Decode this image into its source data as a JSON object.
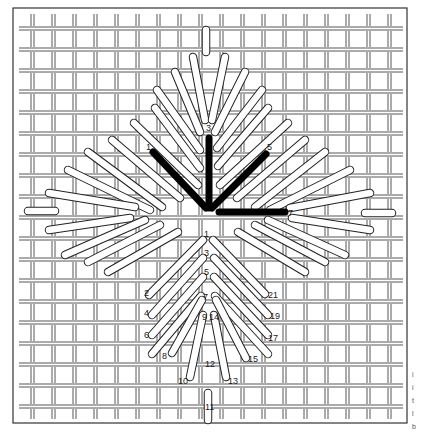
{
  "diagram": {
    "colors": {
      "background": "#ffffff",
      "frame": "#333333",
      "canvas_thread": "#444444",
      "stitch_fill": "#ffffff",
      "stitch_outline": "#222222",
      "highlight_stitch": "#000000",
      "label": "#1a1a1a"
    },
    "frame": {
      "x": 13,
      "y": 8,
      "w": 394,
      "h": 415
    },
    "grid": {
      "x_start": 31,
      "y_start": 27,
      "spacing": 21,
      "count_x": 18,
      "count_y": 19,
      "thread_gap": 3,
      "extent_x": [
        19,
        403
      ],
      "extent_y": [
        14,
        419
      ]
    },
    "top_leaf": {
      "description": "Upper leaf with highlighted first stitches",
      "highlight_stitches": [
        {
          "from": [
            153,
            152
          ],
          "to": [
            206,
            208
          ],
          "label": "1"
        },
        {
          "from": [
            209,
            138
          ],
          "to": [
            209,
            208
          ],
          "label": "3"
        },
        {
          "from": [
            266,
            154
          ],
          "to": [
            212,
            208
          ],
          "label": "5"
        },
        {
          "from": [
            219,
            212
          ],
          "to": [
            285,
            212
          ],
          "label": "7"
        }
      ],
      "white_stitches": [
        [
          [
            206,
            30
          ],
          [
            206,
            52
          ]
        ],
        [
          [
            193,
            57
          ],
          [
            205,
            120
          ]
        ],
        [
          [
            225,
            57
          ],
          [
            212,
            120
          ]
        ],
        [
          [
            175,
            72
          ],
          [
            200,
            132
          ]
        ],
        [
          [
            245,
            72
          ],
          [
            215,
            132
          ]
        ],
        [
          [
            157,
            90
          ],
          [
            200,
            150
          ]
        ],
        [
          [
            262,
            90
          ],
          [
            217,
            148
          ]
        ],
        [
          [
            155,
            108
          ],
          [
            200,
            168
          ]
        ],
        [
          [
            268,
            108
          ],
          [
            218,
            166
          ]
        ],
        [
          [
            134,
            123
          ],
          [
            198,
            185
          ]
        ],
        [
          [
            288,
            123
          ],
          [
            220,
            185
          ]
        ],
        [
          [
            112,
            140
          ],
          [
            180,
            198
          ]
        ],
        [
          [
            305,
            140
          ],
          [
            237,
            198
          ]
        ],
        [
          [
            88,
            152
          ],
          [
            162,
            207
          ]
        ],
        [
          [
            325,
            152
          ],
          [
            255,
            207
          ]
        ],
        [
          [
            68,
            170
          ],
          [
            150,
            210
          ]
        ],
        [
          [
            350,
            170
          ],
          [
            270,
            210
          ]
        ],
        [
          [
            49,
            193
          ],
          [
            135,
            207
          ]
        ],
        [
          [
            370,
            193
          ],
          [
            290,
            208
          ]
        ],
        [
          [
            28,
            211
          ],
          [
            55,
            211
          ]
        ],
        [
          [
            365,
            213
          ],
          [
            392,
            213
          ]
        ],
        [
          [
            49,
            230
          ],
          [
            130,
            218
          ]
        ],
        [
          [
            370,
            230
          ],
          [
            292,
            218
          ]
        ],
        [
          [
            65,
            255
          ],
          [
            145,
            220
          ]
        ],
        [
          [
            345,
            255
          ],
          [
            268,
            220
          ]
        ],
        [
          [
            88,
            262
          ],
          [
            160,
            225
          ]
        ],
        [
          [
            325,
            262
          ],
          [
            255,
            225
          ]
        ],
        [
          [
            108,
            272
          ],
          [
            178,
            232
          ]
        ],
        [
          [
            305,
            272
          ],
          [
            238,
            232
          ]
        ]
      ],
      "labels": [
        {
          "text": "1",
          "x": 146,
          "y": 150
        },
        {
          "text": "3",
          "x": 206,
          "y": 131
        },
        {
          "text": "5",
          "x": 267,
          "y": 150
        },
        {
          "text": "7",
          "x": 288,
          "y": 216
        }
      ]
    },
    "bottom_leaf": {
      "description": "Lower leaf with numbered stitch sequence",
      "white_stitches": [
        [
          [
            149,
            295
          ],
          [
            203,
            240
          ]
        ],
        [
          [
            265,
            294
          ],
          [
            213,
            240
          ]
        ],
        [
          [
            152,
            315
          ],
          [
            203,
            258
          ]
        ],
        [
          [
            268,
            315
          ],
          [
            214,
            258
          ]
        ],
        [
          [
            152,
            335
          ],
          [
            203,
            277
          ]
        ],
        [
          [
            268,
            335
          ],
          [
            214,
            277
          ]
        ],
        [
          [
            152,
            354
          ],
          [
            201,
            296
          ]
        ],
        [
          [
            268,
            354
          ],
          [
            215,
            296
          ]
        ],
        [
          [
            172,
            353
          ],
          [
            202,
            300
          ]
        ],
        [
          [
            246,
            358
          ],
          [
            216,
            300
          ]
        ],
        [
          [
            190,
            377
          ],
          [
            203,
            315
          ]
        ],
        [
          [
            226,
            377
          ],
          [
            214,
            315
          ]
        ],
        [
          [
            208,
            393
          ],
          [
            208,
            420
          ]
        ]
      ],
      "labels": [
        {
          "text": "1",
          "x": 204,
          "y": 237
        },
        {
          "text": "3",
          "x": 204,
          "y": 256
        },
        {
          "text": "5",
          "x": 204,
          "y": 275
        },
        {
          "text": "7",
          "x": 203,
          "y": 300
        },
        {
          "text": "2",
          "x": 144,
          "y": 296
        },
        {
          "text": "4",
          "x": 144,
          "y": 316
        },
        {
          "text": "6",
          "x": 144,
          "y": 338
        },
        {
          "text": "8",
          "x": 162,
          "y": 359
        },
        {
          "text": "9",
          "x": 202,
          "y": 320
        },
        {
          "text": "14",
          "x": 209,
          "y": 320
        },
        {
          "text": "10",
          "x": 178,
          "y": 384
        },
        {
          "text": "12",
          "x": 205,
          "y": 367
        },
        {
          "text": "11",
          "x": 205,
          "y": 410
        },
        {
          "text": "13",
          "x": 228,
          "y": 384
        },
        {
          "text": "15",
          "x": 248,
          "y": 362
        },
        {
          "text": "17",
          "x": 268,
          "y": 341
        },
        {
          "text": "19",
          "x": 270,
          "y": 319
        },
        {
          "text": "21",
          "x": 268,
          "y": 298
        }
      ]
    },
    "side_text": [
      "i",
      "i",
      "t",
      "l",
      "b"
    ]
  }
}
